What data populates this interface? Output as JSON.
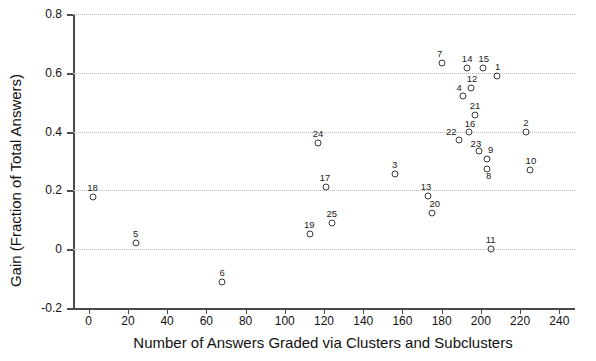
{
  "chart_data": {
    "type": "scatter",
    "title": "",
    "xlabel": "Number of Answers Graded via Clusters and Subclusters",
    "ylabel": "Gain (Fraction of Total Answers)",
    "xlim": [
      -8,
      248
    ],
    "ylim": [
      -0.2,
      0.8
    ],
    "xticks": [
      0,
      20,
      40,
      60,
      80,
      100,
      120,
      140,
      160,
      180,
      200,
      220,
      240
    ],
    "yticks": [
      -0.2,
      0,
      0.2,
      0.4,
      0.6,
      0.8
    ],
    "ytick_labels": [
      "-0.2",
      "0",
      "0.2",
      "0.4",
      "0.6",
      "0.8"
    ],
    "xtick_labels": [
      "0",
      "20",
      "40",
      "60",
      "80",
      "100",
      "120",
      "140",
      "160",
      "180",
      "200",
      "220",
      "240"
    ],
    "grid": "horizontal-dotted",
    "legend": "none",
    "marker": "open-circle",
    "marker_color": "#3a3a3a",
    "points": [
      {
        "label": "18",
        "x": 2,
        "y": 0.178,
        "label_dx": 0,
        "label_dy": -5
      },
      {
        "label": "5",
        "x": 24,
        "y": 0.022,
        "label_dx": 0,
        "label_dy": -5
      },
      {
        "label": "6",
        "x": 68,
        "y": -0.112,
        "label_dx": 0,
        "label_dy": -5
      },
      {
        "label": "19",
        "x": 113,
        "y": 0.053,
        "label_dx": -1,
        "label_dy": -5
      },
      {
        "label": "24",
        "x": 117,
        "y": 0.36,
        "label_dx": 0,
        "label_dy": -5
      },
      {
        "label": "25",
        "x": 124,
        "y": 0.09,
        "label_dx": 0,
        "label_dy": -5
      },
      {
        "label": "17",
        "x": 121,
        "y": 0.213,
        "label_dx": -1,
        "label_dy": -5
      },
      {
        "label": "3",
        "x": 156,
        "y": 0.257,
        "label_dx": 0,
        "label_dy": -5
      },
      {
        "label": "13",
        "x": 173,
        "y": 0.18,
        "label_dx": -2,
        "label_dy": -5
      },
      {
        "label": "20",
        "x": 175,
        "y": 0.122,
        "label_dx": 3,
        "label_dy": -5
      },
      {
        "label": "7",
        "x": 180,
        "y": 0.635,
        "label_dx": -2,
        "label_dy": -5
      },
      {
        "label": "22",
        "x": 189,
        "y": 0.37,
        "label_dx": -8,
        "label_dy": -4
      },
      {
        "label": "4",
        "x": 191,
        "y": 0.52,
        "label_dx": -4,
        "label_dy": -4
      },
      {
        "label": "14",
        "x": 193,
        "y": 0.617,
        "label_dx": 0,
        "label_dy": -5
      },
      {
        "label": "16",
        "x": 194,
        "y": 0.4,
        "label_dx": 1,
        "label_dy": -4
      },
      {
        "label": "12",
        "x": 195,
        "y": 0.548,
        "label_dx": 1,
        "label_dy": -5
      },
      {
        "label": "21",
        "x": 197,
        "y": 0.455,
        "label_dx": 0,
        "label_dy": -5
      },
      {
        "label": "23",
        "x": 199,
        "y": 0.333,
        "label_dx": -3,
        "label_dy": -3
      },
      {
        "label": "15",
        "x": 201,
        "y": 0.617,
        "label_dx": 1,
        "label_dy": -5
      },
      {
        "label": "9",
        "x": 203,
        "y": 0.308,
        "label_dx": 4,
        "label_dy": -5
      },
      {
        "label": "8",
        "x": 203,
        "y": 0.272,
        "label_dx": 2,
        "label_dy": 11
      },
      {
        "label": "11",
        "x": 205,
        "y": 0.0,
        "label_dx": 0,
        "label_dy": -5
      },
      {
        "label": "1",
        "x": 208,
        "y": 0.59,
        "label_dx": 1,
        "label_dy": -5
      },
      {
        "label": "2",
        "x": 223,
        "y": 0.398,
        "label_dx": 0,
        "label_dy": -5
      },
      {
        "label": "10",
        "x": 225,
        "y": 0.27,
        "label_dx": 1,
        "label_dy": -5
      }
    ]
  }
}
